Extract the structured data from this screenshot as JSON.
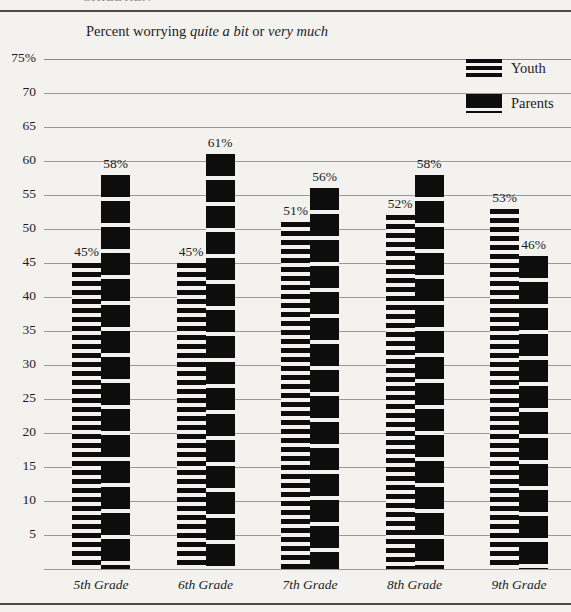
{
  "title_remnant": "CHILDREN",
  "subtitle": {
    "lead": "Percent worrying ",
    "em1": "quite a bit",
    "mid": " or ",
    "em2": "very much"
  },
  "legend": {
    "items": [
      {
        "label": "Youth",
        "pattern": "fine-stripes",
        "color": "#0d0d0d"
      },
      {
        "label": "Parents",
        "pattern": "thick-blocks",
        "color": "#0d0d0d"
      }
    ]
  },
  "chart_data": {
    "type": "bar",
    "title": "",
    "subtitle": "Percent worrying quite a bit or very much",
    "xlabel": "",
    "ylabel": "",
    "categories": [
      "5th Grade",
      "6th Grade",
      "7th Grade",
      "8th Grade",
      "9th Grade"
    ],
    "series": [
      {
        "name": "Youth",
        "values": [
          45,
          45,
          51,
          52,
          53
        ],
        "labels": [
          "45%",
          "45%",
          "51%",
          "52%",
          "53%"
        ]
      },
      {
        "name": "Parents",
        "values": [
          58,
          61,
          56,
          58,
          46
        ],
        "labels": [
          "58%",
          "61%",
          "56%",
          "58%",
          "46%"
        ]
      }
    ],
    "ylim": [
      0,
      75
    ],
    "ytick_values": [
      75,
      70,
      65,
      60,
      55,
      50,
      45,
      40,
      35,
      30,
      25,
      20,
      15,
      10,
      5
    ],
    "ytick_labels": [
      "75%",
      "70",
      "65",
      "60",
      "55",
      "50",
      "45",
      "40",
      "35",
      "30",
      "25",
      "20",
      "15",
      "10",
      "5"
    ],
    "grid": true,
    "legend_position": "top-right",
    "background": "#f3f2ef",
    "bar_color": "#0d0d0d"
  }
}
